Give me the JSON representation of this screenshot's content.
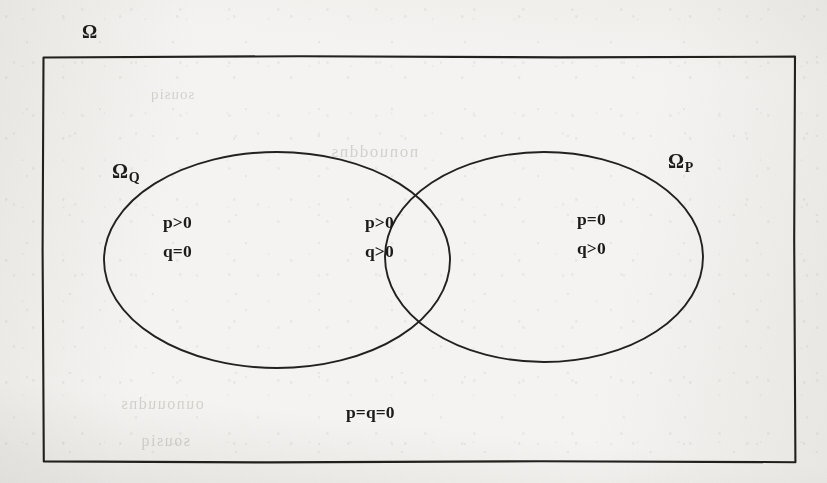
{
  "figure": {
    "type": "venn-diagram",
    "ink_color": "#23211e",
    "paper_color": "#f4f3f1"
  },
  "universe": {
    "label": "Ω",
    "name": "universal-set"
  },
  "sets": {
    "left": {
      "label_base": "Ω",
      "label_sub": "Q",
      "name": "omega-q"
    },
    "right": {
      "label_base": "Ω",
      "label_sub": "P",
      "name": "omega-p"
    }
  },
  "regions": {
    "left_only": {
      "line1": "p>0",
      "line2": "q=0"
    },
    "intersection": {
      "line1": "p>0",
      "line2": "q>0"
    },
    "right_only": {
      "line1": "p=0",
      "line2": "q>0"
    },
    "outside": {
      "line1": "p=q=0"
    }
  },
  "bleed_through": {
    "note": "faint mirrored text showing through from the reverse side of the scanned page",
    "lines": [
      "sousiq",
      "nonuoddns",
      "ounouudns",
      "sousiq"
    ]
  }
}
